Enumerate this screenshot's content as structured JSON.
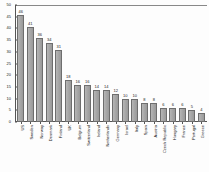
{
  "chart_data": {
    "type": "bar",
    "title": "",
    "subtitle": "",
    "xlabel": "",
    "ylabel": "",
    "ylim": [
      0,
      50
    ],
    "ytick_step": 5,
    "grid": false,
    "legend": null,
    "orientation": "vertical",
    "value_labels_shown": true,
    "categories": [
      "US",
      "Sweden",
      "Norway",
      "Denmark",
      "Finland",
      "UK",
      "Belgium",
      "Switzerland",
      "Ireland",
      "Netherlands",
      "Germany",
      "Israel",
      "Italy",
      "Spain",
      "Austria",
      "Czech Republic",
      "Hungary",
      "France",
      "Portugal",
      "Greece"
    ],
    "values": [
      46,
      41,
      36,
      34,
      31,
      18,
      16,
      16,
      14,
      14,
      12,
      10,
      10,
      8,
      8,
      6,
      6,
      6,
      5,
      4
    ],
    "yticks": [
      0,
      5,
      10,
      15,
      20,
      25,
      30,
      35,
      40,
      45,
      50
    ],
    "ytick_labels": [
      "0",
      "5",
      "10",
      "15",
      "20",
      "25",
      "30",
      "35",
      "40",
      "45",
      "50"
    ],
    "colors": {
      "bar_fill": "#a8a8a8",
      "bar_edge": "#6e6e6e",
      "axis": "#555555",
      "text": "#1a1a1a",
      "background": "#fdfdfd"
    }
  }
}
